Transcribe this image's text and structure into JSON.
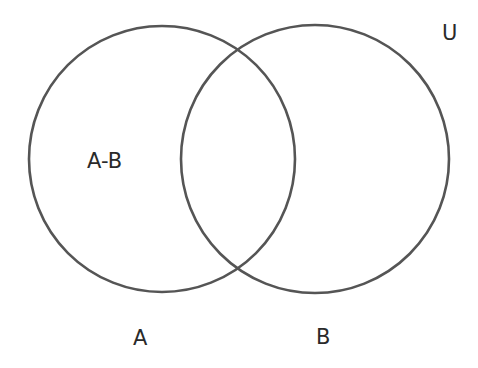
{
  "diagram": {
    "type": "venn",
    "universe_label": "U",
    "region_label": "A-B",
    "sets": [
      {
        "name": "A",
        "label": "A",
        "cx": 162,
        "cy": 159,
        "r": 133
      },
      {
        "name": "B",
        "label": "B",
        "cx": 315,
        "cy": 159,
        "r": 134
      }
    ],
    "colors": {
      "background": "#ffffff",
      "stroke": "#555555",
      "text": "#2a2a2a"
    }
  }
}
